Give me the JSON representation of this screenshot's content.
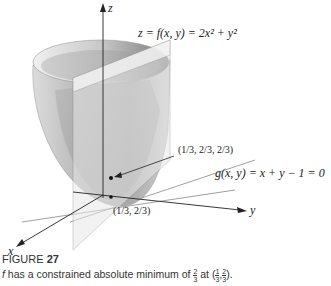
{
  "figure": {
    "surface_equation": "z = f(x, y) = 2x² + y²",
    "constraint_equation": "g(x, y) = x + y − 1 = 0",
    "axes": {
      "z": "z",
      "y": "y",
      "x": "x"
    },
    "point_3d_label": "(1/3, 2/3, 2/3)",
    "point_2d_label": "(1/3, 2/3)",
    "colors": {
      "surface_light": "#e6e6e6",
      "surface_dark": "#8a8a8a",
      "plane": "#d9d9d9",
      "axis": "#222222"
    }
  },
  "caption": {
    "title_prefix": "FIGURE",
    "title_number": "27",
    "text_f": "f",
    "text_body": " has a constrained absolute minimum of ",
    "min_num": "2",
    "min_den": "3",
    "text_at": " at (",
    "pt_x_num": "1",
    "pt_x_den": "3",
    "pt_y_num": "2",
    "pt_y_den": "3",
    "text_end": ")."
  }
}
